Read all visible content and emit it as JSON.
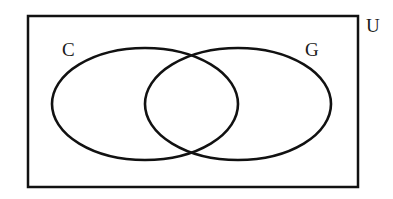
{
  "figure": {
    "kind": "venn-diagram",
    "background_color": "#ffffff",
    "stroke_color": "#111111",
    "universe": {
      "label": "U",
      "label_x": 366,
      "label_y": 32,
      "rect": {
        "x": 28,
        "y": 16,
        "width": 330,
        "height": 171
      },
      "stroke_width": 2.5
    },
    "sets": [
      {
        "id": "set-c",
        "label": "C",
        "label_x": 62,
        "label_y": 56,
        "cx": 145,
        "cy": 104,
        "rx": 93,
        "ry": 56,
        "stroke_width": 2.6
      },
      {
        "id": "set-g",
        "label": "G",
        "label_x": 305,
        "label_y": 56,
        "cx": 238,
        "cy": 104,
        "rx": 93,
        "ry": 56,
        "stroke_width": 2.6
      }
    ],
    "intersection": {
      "top_crossing_x": 190,
      "top_crossing_y": 54,
      "bottom_crossing_x": 190,
      "bottom_crossing_y": 155
    }
  }
}
